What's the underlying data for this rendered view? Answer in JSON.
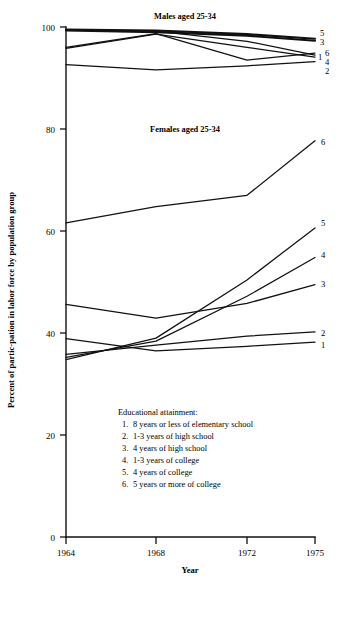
{
  "chart_data": {
    "type": "line",
    "title": "",
    "xlabel": "Year",
    "ylabel": "Percent of partic-pation in labor force by population group",
    "x": [
      1964,
      1968,
      1972,
      1975
    ],
    "xlim": [
      1964,
      1975
    ],
    "ylim": [
      0,
      100
    ],
    "xticks": [
      "1964",
      "1968",
      "1972",
      "1975"
    ],
    "yticks": [
      "0",
      "20",
      "40",
      "60",
      "80",
      "100"
    ],
    "grid": false,
    "legend_position": "inside-lower-center",
    "panels": [
      {
        "name": "males",
        "title": "Males aged 25-34",
        "series": [
          {
            "name": "1",
            "label": "1",
            "values": [
              99.4,
              99.2,
              97.2,
              94.5
            ]
          },
          {
            "name": "2",
            "label": "2",
            "values": [
              92.6,
              91.6,
              92.4,
              93.2
            ]
          },
          {
            "name": "3",
            "label": "3",
            "values": [
              99.3,
              99.0,
              98.3,
              97.3
            ]
          },
          {
            "name": "4",
            "label": "4",
            "values": [
              95.8,
              98.6,
              96.0,
              94.1
            ]
          },
          {
            "name": "5",
            "label": "5",
            "values": [
              99.5,
              99.3,
              98.6,
              97.7
            ]
          },
          {
            "name": "6",
            "label": "6",
            "values": [
              96.0,
              98.7,
              93.5,
              94.9
            ]
          }
        ]
      },
      {
        "name": "females",
        "title": "Females aged 25-34",
        "series": [
          {
            "name": "1",
            "label": "1",
            "values": [
              38.9,
              36.5,
              37.4,
              38.2
            ]
          },
          {
            "name": "2",
            "label": "2",
            "values": [
              35.8,
              37.6,
              39.4,
              40.2
            ]
          },
          {
            "name": "3",
            "label": "3",
            "values": [
              45.6,
              42.9,
              45.8,
              49.5
            ]
          },
          {
            "name": "4",
            "label": "4",
            "values": [
              35.2,
              38.4,
              47.2,
              54.8
            ]
          },
          {
            "name": "5",
            "label": "5",
            "values": [
              34.8,
              39.0,
              50.4,
              60.6
            ]
          },
          {
            "name": "6",
            "label": "6",
            "values": [
              61.6,
              64.8,
              67.0,
              77.7
            ]
          }
        ]
      }
    ],
    "legend": {
      "heading": "Educational attainment:",
      "entries": [
        {
          "num": "1.",
          "text": "8 years or less of elementary school"
        },
        {
          "num": "2.",
          "text": "1-3 years of high school"
        },
        {
          "num": "3.",
          "text": "4 years of high school"
        },
        {
          "num": "4.",
          "text": "1-3 years of college"
        },
        {
          "num": "5.",
          "text": "4 years of college"
        },
        {
          "num": "6.",
          "text": "5 years or more of college"
        }
      ]
    },
    "right_labels_males": [
      "5",
      "3",
      "1",
      "6",
      "4",
      "2"
    ],
    "right_labels_females": [
      "6",
      "5",
      "4",
      "3",
      "2",
      "1"
    ]
  }
}
